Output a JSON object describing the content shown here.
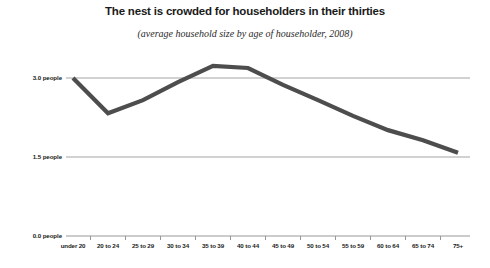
{
  "chart_data": {
    "type": "line",
    "title": "The nest is crowded for householders in their thirties",
    "subtitle": "(average household size by age of householder, 2008)",
    "xlabel": "",
    "ylabel": "",
    "categories": [
      "under 20",
      "20 to 24",
      "25 to 29",
      "30 to 34",
      "35 to 39",
      "40 to 44",
      "45 to 49",
      "50 to 54",
      "55 to 59",
      "60 to 64",
      "65 to 74",
      "75+"
    ],
    "values": [
      3.0,
      2.33,
      2.58,
      2.92,
      3.23,
      3.19,
      2.87,
      2.58,
      2.28,
      2.01,
      1.82,
      1.58
    ],
    "ylim": [
      0.0,
      3.75
    ],
    "ytick_values": [
      3.0,
      1.5,
      0.0
    ],
    "ytick_labels": [
      "3.0 people",
      "1.5 people",
      "0.0 people"
    ],
    "grid": true,
    "legend": false,
    "series_color": "#4d4d4d",
    "gridline_color": "#9a9a9a",
    "axis_color": "#8c8c8c"
  }
}
